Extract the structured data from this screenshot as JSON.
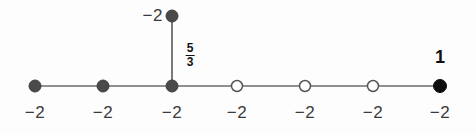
{
  "diagram": {
    "type": "weighted-graph-plumbing-diagram",
    "background_color": "#fdfdfd",
    "node_fill_dark": "#4a4a4a",
    "node_fill_black": "#0d0d0d",
    "node_fill_open": "#ffffff",
    "node_stroke": "#555555",
    "edge_color": "#6b6b6b",
    "chain_nodes": [
      {
        "id": "n1",
        "x": 35,
        "y": 86,
        "style": "filled-gray",
        "radius": 6.0,
        "weight": "−2"
      },
      {
        "id": "n2",
        "x": 103,
        "y": 86,
        "style": "filled-gray",
        "radius": 6.0,
        "weight": "−2"
      },
      {
        "id": "n3",
        "x": 172,
        "y": 86,
        "style": "filled-gray",
        "radius": 6.0,
        "weight": "−2"
      },
      {
        "id": "n4",
        "x": 237,
        "y": 86,
        "style": "open",
        "radius": 5.5,
        "weight": "−2"
      },
      {
        "id": "n5",
        "x": 305,
        "y": 86,
        "style": "open",
        "radius": 5.5,
        "weight": "−2"
      },
      {
        "id": "n6",
        "x": 373,
        "y": 86,
        "style": "open",
        "radius": 5.5,
        "weight": "−2"
      },
      {
        "id": "n7",
        "x": 440,
        "y": 86,
        "style": "filled-black",
        "radius": 6.5,
        "weight": "−2"
      }
    ],
    "branch_node": {
      "id": "nb",
      "x": 172,
      "y": 16,
      "style": "filled-gray",
      "radius": 6.0,
      "weight": "−2"
    },
    "edge_label": {
      "numerator": "5",
      "denominator": "3",
      "x": 190,
      "y": 42
    },
    "multiplicity_label": {
      "text": "1",
      "x": 440,
      "y": 48
    }
  }
}
